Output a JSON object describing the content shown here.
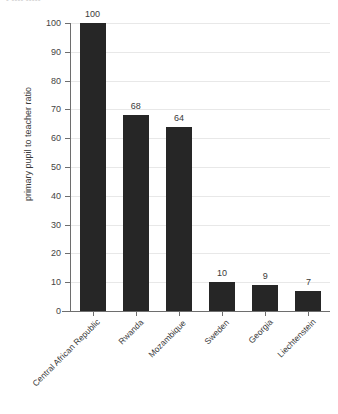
{
  "top_fragment": {
    "text": "• •••• •••••"
  },
  "chart_data": {
    "type": "bar",
    "title": "",
    "xlabel": "",
    "ylabel": "primary pupil to teacher ratio",
    "categories": [
      "Central African Republic",
      "Rwanda",
      "Mozambique",
      "Sweden",
      "Georgia",
      "Liechtenstein"
    ],
    "values": [
      100,
      68,
      64,
      10,
      9,
      7
    ],
    "value_labels": [
      "100",
      "68",
      "64",
      "10",
      "9",
      "7"
    ],
    "ylim": [
      0,
      100
    ],
    "yticks": [
      0,
      10,
      20,
      30,
      40,
      50,
      60,
      70,
      80,
      90,
      100
    ],
    "ytick_labels": [
      "0",
      "10",
      "20",
      "30",
      "40",
      "50",
      "60",
      "70",
      "80",
      "90",
      "100"
    ],
    "grid": true,
    "grid_axis": "y",
    "legend": false,
    "legend_position": "none",
    "bar_color": "#262626",
    "gridline_color": "#e8e8e8",
    "axis_color": "#6e6e6e",
    "background": "#ffffff",
    "xlabel_rotation": -45
  }
}
